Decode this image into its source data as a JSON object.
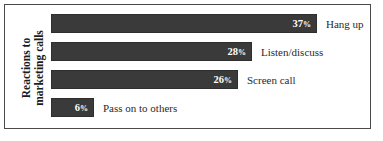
{
  "chart_data": {
    "type": "bar",
    "orientation": "horizontal",
    "title": "",
    "xlabel": "",
    "ylabel": "Reactions to marketing calls",
    "ylabel_lines": [
      "Reactions to",
      "marketing calls"
    ],
    "categories": [
      "Hang up",
      "Listen/discuss",
      "Screen call",
      "Pass on to others"
    ],
    "values": [
      37,
      28,
      26,
      6
    ],
    "value_labels": [
      "37",
      "28",
      "26",
      "6"
    ],
    "value_unit": "%",
    "xlim": [
      0,
      44
    ],
    "grid": false,
    "legend": false,
    "bar_color": "#3a3a3a",
    "value_text_color": "#ffffff",
    "label_text_color": "#2a2a2a",
    "background_color": "#ffffff",
    "border_color": "#4a4a4a"
  }
}
